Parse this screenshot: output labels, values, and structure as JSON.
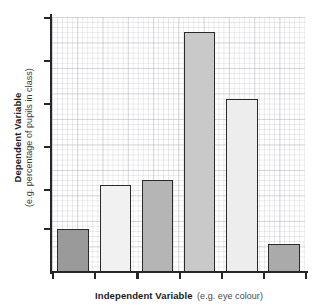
{
  "chart_data": {
    "type": "bar",
    "title": "",
    "subtitle": "",
    "xlabel": "Independent Variable (e.g. eye colour)",
    "xlabel_bold_part": "Independent Variable",
    "xlabel_plain_part": "(e.g. eye colour)",
    "ylabel": "Dependent Variable (e.g. percentage of pupils in class)",
    "ylabel_bold_part": "Dependent Variable",
    "ylabel_plain_part": "(e.g. percentage of pupils in class)",
    "categories": [
      "1",
      "2",
      "3",
      "4",
      "5",
      "6"
    ],
    "values": [
      17,
      34,
      36,
      94,
      68,
      11
    ],
    "ylim": [
      0,
      100
    ],
    "xlim": [
      0,
      6
    ],
    "grid": true,
    "grid_style": "graph-paper",
    "legend": false,
    "legend_position": "none",
    "y_tick_count": 6,
    "y_tick_labels": [
      "",
      "",
      "",
      "",
      "",
      ""
    ],
    "x_tick_labels": [
      "",
      "",
      "",
      "",
      "",
      "",
      ""
    ],
    "bar_colors": [
      "#9a9a9a",
      "#f1f1f1",
      "#b5b5b5",
      "#c9c9c9",
      "#ededed",
      "#aaaaaa"
    ],
    "bar_edge_color": "#2a2a2a",
    "axis_color": "#262626",
    "background_color": "#ffffff",
    "bars": [
      {
        "index": 1,
        "value": 17,
        "color": "#9a9a9a"
      },
      {
        "index": 2,
        "value": 34,
        "color": "#f1f1f1"
      },
      {
        "index": 3,
        "value": 36,
        "color": "#b5b5b5"
      },
      {
        "index": 4,
        "value": 94,
        "color": "#c9c9c9"
      },
      {
        "index": 5,
        "value": 68,
        "color": "#ededed"
      },
      {
        "index": 6,
        "value": 11,
        "color": "#aaaaaa"
      }
    ]
  },
  "axes": {
    "y_title_bold": "Dependent Variable",
    "y_title_plain": "(e.g. percentage of pupils in class)",
    "x_title_bold": "Independent Variable",
    "x_title_plain": "(e.g. eye colour)"
  }
}
